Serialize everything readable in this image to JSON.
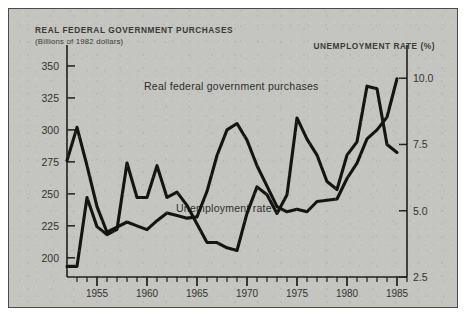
{
  "figure": {
    "background_color": "#c4c4c0",
    "border_color": "#4a4a46",
    "ink_color": "#1a1a18"
  },
  "titles": {
    "left_title": "REAL FEDERAL GOVERNMENT PURCHASES",
    "left_subtitle": "(Billions of 1982 dollars)",
    "right_title": "UNEMPLOYMENT RATE (%)"
  },
  "chart_data": {
    "type": "line",
    "title": "REAL FEDERAL GOVERNMENT PURCHASES",
    "subtitle": "(Billions of 1982 dollars)",
    "xlabel": "",
    "ylabel": "Billions of 1982 dollars",
    "y2label": "Unemployment rate (%)",
    "grid": false,
    "legend": "inline-annotations",
    "xlim": [
      1952,
      1986
    ],
    "ylim": [
      185,
      357
    ],
    "y2lim": [
      2.5,
      10.8
    ],
    "xticks": [
      1955,
      1960,
      1965,
      1970,
      1975,
      1980,
      1985
    ],
    "xtick_labels": [
      "1955",
      "1960",
      "1965",
      "1970",
      "1975",
      "1980",
      "1985"
    ],
    "xtick_minor_step": 1,
    "yticks": [
      200,
      225,
      250,
      275,
      300,
      325,
      350
    ],
    "ytick_labels": [
      "200",
      "225",
      "250",
      "275",
      "300",
      "325",
      "350"
    ],
    "y2ticks": [
      2.5,
      5.0,
      7.5,
      10.0
    ],
    "y2tick_labels": [
      "2.5",
      "5.0",
      "7.5",
      "10.0"
    ],
    "x": [
      1952,
      1953,
      1954,
      1955,
      1956,
      1957,
      1958,
      1959,
      1960,
      1961,
      1962,
      1963,
      1964,
      1965,
      1966,
      1967,
      1968,
      1969,
      1970,
      1971,
      1972,
      1973,
      1974,
      1975,
      1976,
      1977,
      1978,
      1979,
      1980,
      1981,
      1982,
      1983,
      1984,
      1985
    ],
    "series": [
      {
        "name": "Real federal government purchases",
        "axis": "left",
        "units": "billions of 1982 dollars",
        "values": [
          276,
          302,
          272,
          240,
          220,
          224,
          228,
          225,
          222,
          229,
          235,
          233,
          231,
          232,
          252,
          280,
          300,
          305,
          292,
          272,
          256,
          240,
          236,
          238,
          236,
          244,
          245,
          246,
          262,
          274,
          293,
          300,
          310,
          340
        ]
      },
      {
        "name": "Unemployment rate",
        "axis": "right",
        "units": "percent",
        "values": [
          2.9,
          2.9,
          5.5,
          4.4,
          4.1,
          4.3,
          6.8,
          5.5,
          5.5,
          6.7,
          5.5,
          5.7,
          5.2,
          4.5,
          3.8,
          3.8,
          3.6,
          3.5,
          4.9,
          5.9,
          5.6,
          4.9,
          5.6,
          8.5,
          7.7,
          7.1,
          6.1,
          5.8,
          7.1,
          7.6,
          9.7,
          9.6,
          7.5,
          7.2
        ]
      }
    ],
    "annotations": [
      {
        "text": "Real federal government purchases",
        "near_x": 1963,
        "near_y": 330
      },
      {
        "text": "Unemployment rate",
        "near_x": 1965,
        "near_y": 5.3
      }
    ]
  }
}
